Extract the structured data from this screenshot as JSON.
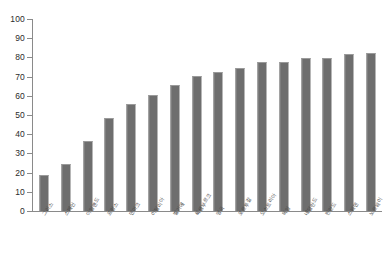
{
  "chart_data": {
    "type": "bar",
    "title": "",
    "subtitle": "",
    "xlabel": "",
    "ylabel": "",
    "ylim": [
      0,
      100
    ],
    "ytick_step": 10,
    "yticks": [
      0,
      10,
      20,
      30,
      40,
      50,
      60,
      70,
      80,
      90,
      100
    ],
    "ytick_labels": [
      "0",
      "10",
      "20",
      "30",
      "40",
      "50",
      "60",
      "70",
      "80",
      "90",
      "100"
    ],
    "grid": false,
    "legend": false,
    "legend_position": "none",
    "bar_color": "#6e6e6e",
    "axis_color": "#8a8a8a",
    "orientation": "vertical",
    "sorted": "ascending",
    "categories": [
      "그리스",
      "스페인",
      "아일랜드",
      "프랑스",
      "덴마크",
      "이탈리아",
      "벨기에",
      "룩셈부르크",
      "영국",
      "포르투갈",
      "오스트리아",
      "독일",
      "네덜란드",
      "핀란드",
      "스웨덴",
      "노르웨이"
    ],
    "values": [
      18,
      24,
      36,
      48,
      55,
      60,
      65,
      70,
      72,
      74,
      77,
      77,
      79,
      79,
      81,
      82
    ]
  }
}
